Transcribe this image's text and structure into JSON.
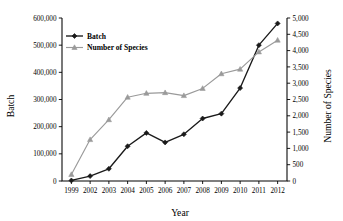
{
  "chart_data": {
    "type": "line",
    "title": "",
    "xlabel": "Year",
    "ylabel": "Batch",
    "y2label": "Number of Species",
    "categories": [
      "1999",
      "2002",
      "2003",
      "2004",
      "2005",
      "2006",
      "2007",
      "2008",
      "2009",
      "2010",
      "2011",
      "2012"
    ],
    "x": [
      1999,
      2002,
      2003,
      2004,
      2005,
      2006,
      2007,
      2008,
      2009,
      2010,
      2011,
      2012
    ],
    "ylim": [
      0,
      600000
    ],
    "y2lim": [
      0,
      5000
    ],
    "yticks": [
      0,
      100000,
      200000,
      300000,
      400000,
      500000,
      600000
    ],
    "ytick_labels": [
      "0",
      "100,000",
      "200,000",
      "300,000",
      "400,000",
      "500,000",
      "600,000"
    ],
    "y2ticks": [
      0,
      500,
      1000,
      1500,
      2000,
      2500,
      3000,
      3500,
      4000,
      4500,
      5000
    ],
    "y2tick_labels": [
      "0",
      "500",
      "1,000",
      "1,500",
      "2,000",
      "2,500",
      "3,000",
      "3,500",
      "4,000",
      "4,500",
      "5,000"
    ],
    "grid": false,
    "legend_position": "upper-left",
    "series": [
      {
        "name": "Batch",
        "axis": "left",
        "color": "#1a1a1a",
        "marker": "diamond",
        "values": [
          2000,
          18000,
          45000,
          128000,
          177000,
          142000,
          172000,
          230000,
          248000,
          342000,
          500000,
          580000
        ]
      },
      {
        "name": "Number of Species",
        "axis": "right",
        "color": "#9a9a9a",
        "marker": "triangle",
        "values": [
          200,
          1270,
          1880,
          2570,
          2690,
          2710,
          2620,
          2840,
          3290,
          3430,
          3960,
          4320
        ]
      }
    ]
  },
  "legend": {
    "items": [
      {
        "label": "Batch"
      },
      {
        "label": "Number of Species"
      }
    ]
  },
  "axes": {
    "left_title": "Batch",
    "right_title": "Number of Species",
    "bottom_title": "Year"
  }
}
